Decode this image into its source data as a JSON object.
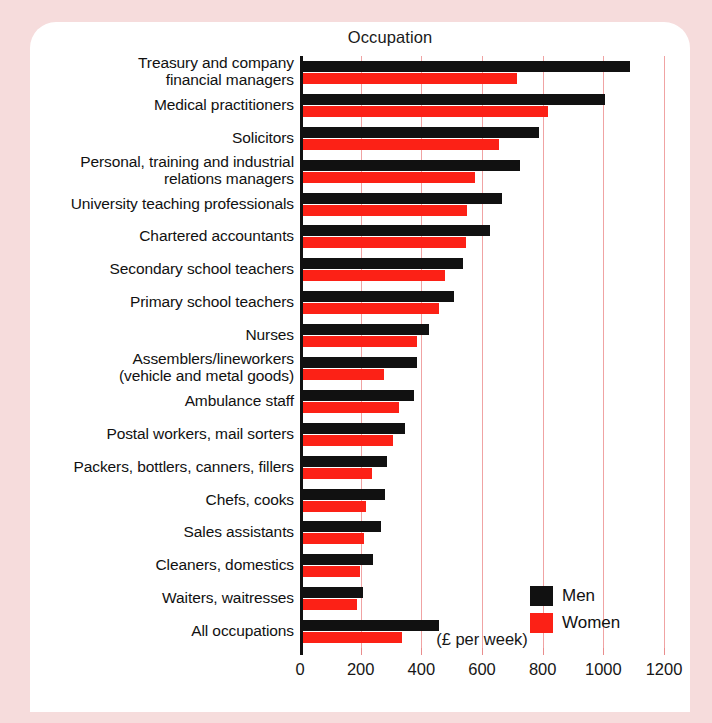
{
  "chart_data": {
    "type": "bar",
    "orientation": "horizontal",
    "title": "Occupation",
    "xlabel": "(£ per week)",
    "ylabel": "",
    "xlim": [
      0,
      1200
    ],
    "xticks": [
      0,
      200,
      400,
      600,
      800,
      1000,
      1200
    ],
    "grid": true,
    "legend_position": "bottom-right",
    "categories": [
      "Treasury and company\nfinancial managers",
      "Medical practitioners",
      "Solicitors",
      "Personal, training and industrial\nrelations managers",
      "University teaching professionals",
      "Chartered accountants",
      "Secondary school teachers",
      "Primary school teachers",
      "Nurses",
      "Assemblers/lineworkers\n(vehicle and metal goods)",
      "Ambulance staff",
      "Postal workers, mail sorters",
      "Packers, bottlers, canners, fillers",
      "Chefs, cooks",
      "Sales assistants",
      "Cleaners, domestics",
      "Waiters, waitresses",
      "All occupations"
    ],
    "series": [
      {
        "name": "Men",
        "color": "#111111",
        "values": [
          1080,
          1000,
          780,
          720,
          660,
          620,
          530,
          500,
          420,
          380,
          370,
          340,
          280,
          275,
          260,
          235,
          200,
          450
        ]
      },
      {
        "name": "Women",
        "color": "#fc2116",
        "values": [
          710,
          810,
          650,
          570,
          545,
          540,
          470,
          450,
          380,
          270,
          320,
          300,
          230,
          210,
          205,
          190,
          180,
          330
        ]
      }
    ]
  },
  "legend": {
    "items": [
      {
        "label": "Men",
        "color": "#111111"
      },
      {
        "label": "Women",
        "color": "#fc2116"
      }
    ]
  },
  "colors": {
    "men": "#111111",
    "women": "#fc2116",
    "gridline": "#f0a3a3",
    "page_background": "#f6dcdc",
    "card_background": "#ffffff"
  }
}
